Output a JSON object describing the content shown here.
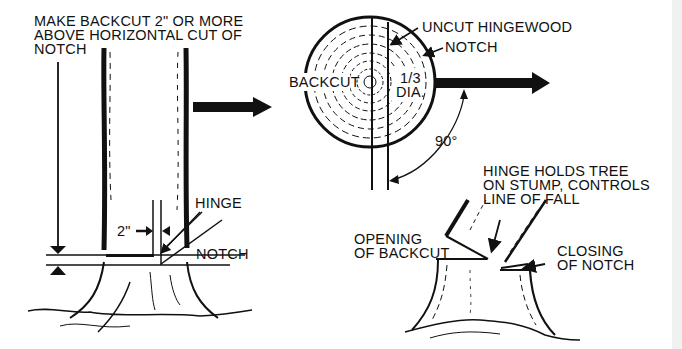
{
  "figure": {
    "left_panel": {
      "instruction_lines": [
        "MAKE BACKCUT 2\" OR MORE",
        "ABOVE HORIZONTAL CUT OF",
        "NOTCH"
      ],
      "hinge_label": "HINGE",
      "notch_label": "NOTCH",
      "dimension_label": "2\""
    },
    "top_right_panel": {
      "uncut_hingewood_label": "UNCUT HINGEWOOD",
      "notch_label": "NOTCH",
      "backcut_label": "BACKCUT",
      "depth_label_lines": [
        "1/3",
        "DIA."
      ],
      "angle_label": "90°"
    },
    "bottom_right_panel": {
      "hinge_note_lines": [
        "HINGE HOLDS TREE",
        "ON STUMP, CONTROLS",
        "LINE OF FALL"
      ],
      "opening_label_lines": [
        "OPENING",
        "OF BACKCUT"
      ],
      "closing_label_lines": [
        "CLOSING",
        "OF NOTCH"
      ]
    },
    "colors": {
      "ink": "#111111",
      "background": "#ffffff"
    }
  }
}
